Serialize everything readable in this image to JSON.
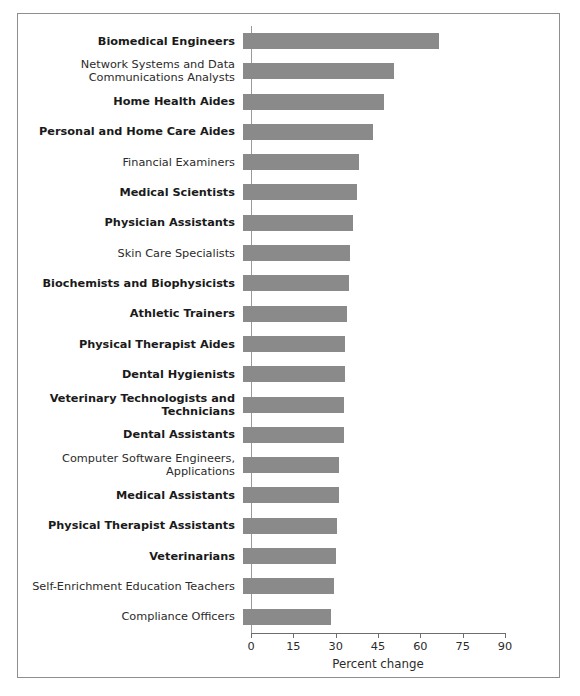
{
  "figure": {
    "border_color": "#8e8e8e",
    "background": "#ffffff"
  },
  "chart_data": {
    "type": "bar",
    "orientation": "horizontal",
    "title": "",
    "subtitle": "",
    "xlabel": "Percent change",
    "ylabel": "",
    "xlim": [
      0,
      90
    ],
    "xticks": [
      0,
      15,
      30,
      45,
      60,
      75,
      90
    ],
    "xtick_labels": [
      "0",
      "15",
      "30",
      "45",
      "60",
      "75",
      "90"
    ],
    "grid": false,
    "legend": null,
    "bar_color": "#8a8a8a",
    "categories": [
      "Biomedical Engineers",
      "Network Systems and Data\nCommunications Analysts",
      "Home Health Aides",
      "Personal and Home Care Aides",
      "Financial Examiners",
      "Medical Scientists",
      "Physician Assistants",
      "Skin Care Specialists",
      "Biochemists and Biophysicists",
      "Athletic Trainers",
      "Physical Therapist Aides",
      "Dental Hygienists",
      "Veterinary Technologists and\nTechnicians",
      "Dental Assistants",
      "Computer Software Engineers,\nApplications",
      "Medical Assistants",
      "Physical Therapist Assistants",
      "Veterinarians",
      "Self-Enrichment Education Teachers",
      "Compliance Officers"
    ],
    "emphasis": [
      true,
      false,
      true,
      true,
      false,
      true,
      true,
      false,
      true,
      true,
      true,
      true,
      true,
      true,
      false,
      true,
      true,
      true,
      false,
      false
    ],
    "values": [
      69.4,
      53.4,
      50.0,
      46.0,
      41.2,
      40.4,
      39.0,
      37.9,
      37.4,
      37.0,
      36.3,
      36.1,
      35.8,
      35.8,
      34.0,
      33.9,
      33.3,
      32.9,
      32.1,
      31.1
    ]
  }
}
